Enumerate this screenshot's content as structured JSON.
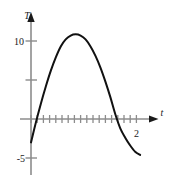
{
  "figure": {
    "name": "parabola-plot",
    "background_color": "#ffffff",
    "axis_color": "#8c8c8c",
    "curve_color": "#111111"
  },
  "chart_data": {
    "type": "line",
    "title": "",
    "subtitle": "",
    "xlabel": "t",
    "ylabel": "T",
    "grid": false,
    "legend": null,
    "xlim": [
      -0.1,
      2.55
    ],
    "ylim": [
      -6.2,
      12.5
    ],
    "y_ticks": [
      -5,
      0,
      5,
      10
    ],
    "y_tick_labels": [
      "-5",
      "",
      "",
      "10"
    ],
    "x_ticks": [
      0,
      0.125,
      0.25,
      0.375,
      0.5,
      0.625,
      0.75,
      0.875,
      1.0,
      1.125,
      1.25,
      1.375,
      1.5,
      1.625,
      1.75,
      1.875,
      2.0,
      2.125
    ],
    "x_tick_labels": [
      "",
      "",
      "",
      "",
      "",
      "",
      "",
      "",
      "",
      "",
      "",
      "",
      "",
      "",
      "",
      "",
      "2",
      ""
    ],
    "annotations": [
      {
        "text": "10",
        "x": -0.12,
        "y": 10
      },
      {
        "text": "-5",
        "x": -0.15,
        "y": -5
      },
      {
        "text": "2",
        "x": 2.05,
        "y": -1.4
      },
      {
        "text": "T",
        "x": 0.0,
        "y": 12.2
      },
      {
        "text": "t",
        "x": 2.5,
        "y": 0.9
      }
    ],
    "series": [
      {
        "name": "T(t)",
        "x": [
          0.0,
          0.1,
          0.2,
          0.3,
          0.4,
          0.5,
          0.6,
          0.7,
          0.8,
          0.9,
          1.0,
          1.1,
          1.2,
          1.3,
          1.4,
          1.5,
          1.6,
          1.7,
          1.8,
          1.9,
          2.0,
          2.1,
          2.2
        ],
        "y": [
          -3.0,
          -0.4,
          2.0,
          4.2,
          6.2,
          7.9,
          9.3,
          10.2,
          10.7,
          10.85,
          10.7,
          10.2,
          9.3,
          8.1,
          6.6,
          4.8,
          2.8,
          0.6,
          -1.2,
          -2.4,
          -3.4,
          -4.2,
          -4.6
        ]
      }
    ]
  }
}
